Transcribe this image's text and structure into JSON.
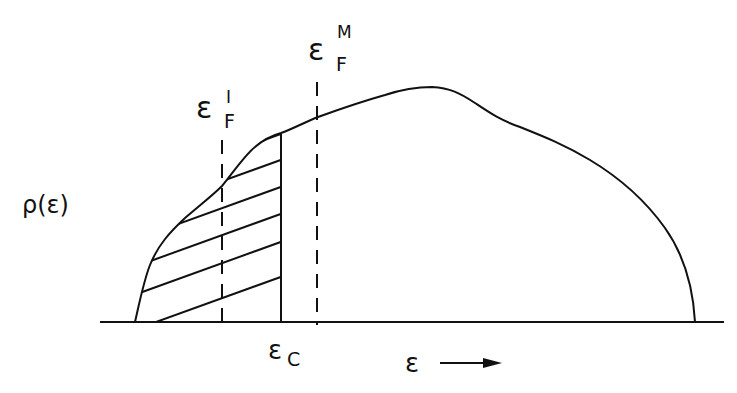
{
  "diagram": {
    "type": "density-of-states",
    "labels": {
      "y_axis": "ρ(ε)",
      "fermi_insulator": {
        "base": "ε",
        "sub": "F",
        "sup": "I"
      },
      "fermi_metal": {
        "base": "ε",
        "sub": "F",
        "sup": "M"
      },
      "mobility_edge": {
        "base": "ε",
        "sub": "C"
      },
      "x_axis": "ε",
      "x_arrow": "⟶"
    },
    "annotations": {
      "hatched_region": "localized states below ε_C",
      "dashed_lines": [
        "ε_F^I",
        "ε_F^M"
      ],
      "solid_vertical": "ε_C"
    },
    "colors": {
      "ink": "#111111",
      "background": "#ffffff"
    }
  }
}
